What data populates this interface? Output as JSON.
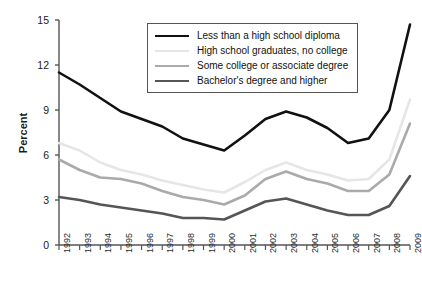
{
  "chart_data": {
    "type": "line",
    "title": "",
    "xlabel": "",
    "ylabel": "Percent",
    "ylim": [
      0,
      15
    ],
    "yticks": [
      0,
      3,
      6,
      9,
      12,
      15
    ],
    "ytick_labels": [
      "0",
      "3",
      "6",
      "9",
      "12",
      "15"
    ],
    "grid": false,
    "legend_position": "top-center",
    "x": [
      1992,
      1993,
      1994,
      1995,
      1996,
      1997,
      1998,
      1999,
      2000,
      2001,
      2002,
      2003,
      2004,
      2005,
      2006,
      2007,
      2008,
      2009
    ],
    "categories": [
      "1992",
      "1993",
      "1994",
      "1995",
      "1996",
      "1997",
      "1998",
      "1999",
      "2000",
      "2001",
      "2002",
      "2003",
      "2004",
      "2005",
      "2006",
      "2007",
      "2008",
      "2009"
    ],
    "series": [
      {
        "name": "Less than a high school diploma",
        "color": "#111111",
        "width": 2.6,
        "values": [
          11.5,
          10.7,
          9.8,
          8.9,
          8.4,
          7.9,
          7.1,
          6.7,
          6.3,
          7.3,
          8.4,
          8.9,
          8.5,
          7.8,
          6.8,
          7.1,
          9.0,
          14.7
        ]
      },
      {
        "name": "High school graduates, no college",
        "color": "#e6e6e6",
        "width": 2.6,
        "values": [
          6.8,
          6.3,
          5.5,
          5.0,
          4.7,
          4.3,
          4.0,
          3.7,
          3.5,
          4.2,
          5.0,
          5.5,
          5.0,
          4.7,
          4.3,
          4.4,
          5.7,
          9.7
        ]
      },
      {
        "name": "Some college or associate degree",
        "color": "#aaaaaa",
        "width": 2.6,
        "values": [
          5.7,
          5.0,
          4.5,
          4.4,
          4.1,
          3.6,
          3.2,
          3.0,
          2.7,
          3.3,
          4.4,
          4.9,
          4.4,
          4.1,
          3.6,
          3.6,
          4.7,
          8.1
        ]
      },
      {
        "name": "Bachelor's degree and higher",
        "color": "#555555",
        "width": 2.6,
        "values": [
          3.2,
          3.0,
          2.7,
          2.5,
          2.3,
          2.1,
          1.8,
          1.8,
          1.7,
          2.3,
          2.9,
          3.1,
          2.7,
          2.3,
          2.0,
          2.0,
          2.6,
          4.6
        ]
      }
    ]
  },
  "legend": {
    "items": [
      {
        "label": "Less than a high school diploma",
        "color": "#111111"
      },
      {
        "label": "High school graduates, no college",
        "color": "#e6e6e6"
      },
      {
        "label": "Some college or associate degree",
        "color": "#aaaaaa"
      },
      {
        "label": "Bachelor's degree and higher",
        "color": "#555555"
      }
    ]
  },
  "axes": {
    "y_title": "Percent",
    "axis_color": "#555555"
  }
}
